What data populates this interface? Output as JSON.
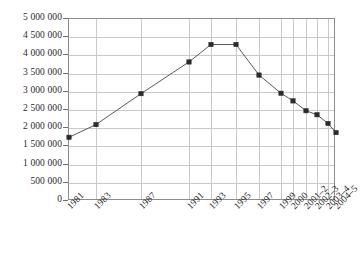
{
  "chart_data": {
    "type": "line",
    "title": "",
    "subtitle": "",
    "xlabel": "",
    "ylabel": "",
    "categories": [
      "1981",
      "1983",
      "1987",
      "1991",
      "1993",
      "1995",
      "1997",
      "1999",
      "2000",
      "2001–2",
      "2002–3",
      "2003–4",
      "2004–5"
    ],
    "values": [
      1750000,
      2100000,
      2950000,
      3820000,
      4300000,
      4300000,
      3460000,
      2960000,
      2750000,
      2480000,
      2370000,
      2130000,
      1880000
    ],
    "series": [
      {
        "name": "",
        "values": [
          1750000,
          2100000,
          2950000,
          3820000,
          4300000,
          4300000,
          3460000,
          2960000,
          2750000,
          2480000,
          2370000,
          2130000,
          1880000
        ]
      }
    ],
    "ylim": [
      0,
      5000000
    ],
    "ytick_values": [
      0,
      500000,
      1000000,
      1500000,
      2000000,
      2500000,
      3000000,
      3500000,
      4000000,
      4500000,
      5000000
    ],
    "ytick_labels": [
      "0",
      "500 000",
      "1 000 000",
      "1 500 000",
      "2 000 000",
      "2 500 000",
      "3 000 000",
      "3 500 000",
      "4 000 000",
      "4 500 000",
      "5 000 000"
    ],
    "xtick_labels": [
      "1981",
      "1983",
      "1987",
      "1991",
      "1993",
      "1995",
      "1997",
      "1999",
      "2000",
      "2001–2",
      "2002–3",
      "2003–4",
      "2004–5"
    ],
    "xtick_positions": [
      0,
      27,
      72,
      120,
      142,
      167,
      190,
      212,
      224,
      237,
      248,
      259,
      267
    ],
    "grid": true,
    "grid_horizontal": true,
    "grid_vertical": true,
    "legend": false,
    "legend_position": "none",
    "marker": "square",
    "colors": {
      "line": "#5a5a5a",
      "marker": "#2b2b2b",
      "grid": "#c9c9c9",
      "axis": "#8c8c8c",
      "text": "#2a2a2a",
      "background": "#ffffff"
    }
  }
}
